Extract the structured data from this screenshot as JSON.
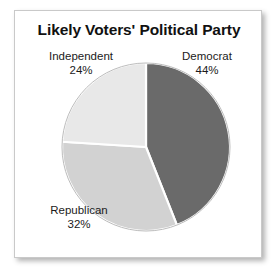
{
  "chart_data": {
    "type": "pie",
    "title": "Likely Voters' Political Party",
    "xlabel": "",
    "ylabel": "",
    "legend_position": "none",
    "grid": false,
    "labels": [
      "Democrat",
      "Republican",
      "Independent"
    ],
    "values": [
      44,
      32,
      24
    ],
    "value_suffix": "%",
    "start_angle_deg": 0,
    "direction": "clockwise",
    "slices": [
      {
        "label": "Democrat",
        "value": 44,
        "value_text": "44%",
        "color": "#6a6a6a",
        "start_deg": 0,
        "end_deg": 158.4
      },
      {
        "label": "Republican",
        "value": 32,
        "value_text": "32%",
        "color": "#d2d2d2",
        "start_deg": 158.4,
        "end_deg": 273.6
      },
      {
        "label": "Independent",
        "value": 24,
        "value_text": "24%",
        "color": "#e8e8e8",
        "start_deg": 273.6,
        "end_deg": 360
      }
    ],
    "separator_color": "#ffffff",
    "colors": {
      "democrat": "#6a6a6a",
      "republican": "#d2d2d2",
      "independent": "#e8e8e8",
      "outline": "#b4b4b4",
      "frame": "#c9c9c9",
      "text": "#1b1b1b",
      "background": "#ffffff"
    }
  }
}
